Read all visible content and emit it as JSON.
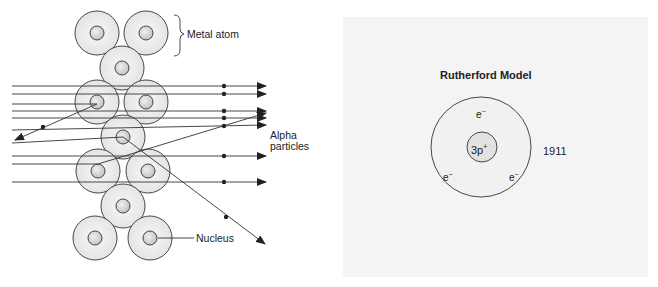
{
  "left_diagram": {
    "name": "Alpha particle scattering through metal foil",
    "labels": {
      "metal_atom": "Metal atom",
      "alpha_particles_line1": "Alpha",
      "alpha_particles_line2": "particles",
      "nucleus": "Nucleus"
    },
    "atoms": [
      {
        "cx": 97,
        "cy": 33
      },
      {
        "cx": 146,
        "cy": 33
      },
      {
        "cx": 122,
        "cy": 68
      },
      {
        "cx": 97,
        "cy": 102
      },
      {
        "cx": 146,
        "cy": 102
      },
      {
        "cx": 123,
        "cy": 137
      },
      {
        "cx": 98,
        "cy": 171
      },
      {
        "cx": 148,
        "cy": 171
      },
      {
        "cx": 123,
        "cy": 206
      },
      {
        "cx": 95,
        "cy": 238
      },
      {
        "cx": 150,
        "cy": 238
      }
    ],
    "atom_radius": 22,
    "nucleus_radius": 7
  },
  "right_diagram": {
    "title": "Rutherford Model",
    "year": "1911",
    "nucleus_label": "3p",
    "nucleus_charge": "+",
    "electron_label": "e",
    "electron_charge": "−",
    "electrons": [
      {
        "position": "top"
      },
      {
        "position": "bottom-left"
      },
      {
        "position": "bottom-right"
      }
    ]
  },
  "colors": {
    "line": "#333333",
    "atom_fill": "#efefef",
    "nucleus_fill": "#d6d6d6",
    "paper": "#f4f4f4"
  }
}
